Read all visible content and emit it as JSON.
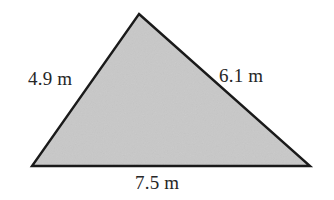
{
  "figure": {
    "type": "triangle",
    "shape_name": "scalene-triangle",
    "fill_color": "#c8c8c8",
    "stroke_color": "#1a1a1a",
    "background_color": "#ffffff",
    "text_color": "#262626",
    "unit": "m",
    "labels": {
      "left_side": "4.9 m",
      "right_side": "6.1 m",
      "bottom_side": "7.5 m"
    },
    "measurements": [
      {
        "side": "left",
        "value": 4.9,
        "unit": "m",
        "text": "4.9 m"
      },
      {
        "side": "right",
        "value": 6.1,
        "unit": "m",
        "text": "6.1 m"
      },
      {
        "side": "bottom",
        "value": 7.5,
        "unit": "m",
        "text": "7.5 m"
      }
    ],
    "vertices": {
      "apex": [
        139,
        14
      ],
      "bottom_left": [
        32,
        166
      ],
      "bottom_right": [
        310,
        166
      ]
    }
  }
}
